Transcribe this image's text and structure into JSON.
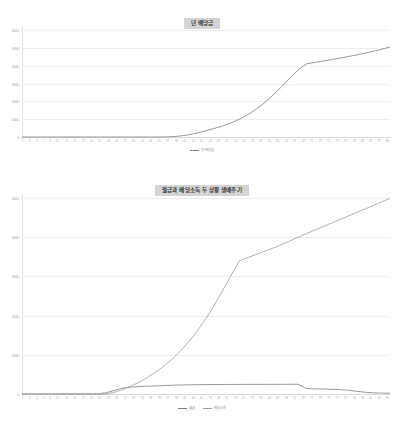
{
  "page": {
    "background": "#ffffff",
    "text_color": "#808080"
  },
  "charts": [
    {
      "id": "chart-1",
      "title": "년 배당금",
      "title_bg": "#d4d4d4",
      "legend": [
        {
          "label": "년 배당금",
          "color": "#7d7d7d"
        }
      ]
    },
    {
      "id": "chart-2",
      "title": "월급과 배당소득 두 상황 생애주기",
      "title_bg": "#d4d4d4",
      "legend": [
        {
          "label": "월급",
          "color": "#7d7d7d"
        },
        {
          "label": "배당소득",
          "color": "#9c9c9c"
        }
      ]
    }
  ],
  "chart_data": [
    {
      "type": "line",
      "title": "년 배당금",
      "xlabel": "",
      "ylabel": "",
      "grid": true,
      "legend_position": "bottom",
      "ylim": [
        0,
        6000
      ],
      "yticks": [
        0,
        1000,
        2000,
        3000,
        4000,
        5000,
        6000
      ],
      "ytick_labels": [
        "0",
        "1000",
        "2000",
        "3000",
        "4000",
        "5000",
        "6000"
      ],
      "x": [
        1,
        3,
        5,
        7,
        9,
        11,
        13,
        15,
        17,
        19,
        21,
        23,
        25,
        27,
        29,
        31,
        33,
        35,
        37,
        39,
        41,
        43,
        45,
        47,
        49,
        51,
        53,
        55,
        57,
        59,
        61,
        63,
        65,
        67,
        69,
        71,
        73,
        75,
        77,
        79,
        81,
        83,
        85,
        87,
        89
      ],
      "xtick_labels": [
        "1",
        "3",
        "5",
        "7",
        "9",
        "11",
        "13",
        "15",
        "17",
        "19",
        "21",
        "23",
        "25",
        "27",
        "29",
        "31",
        "33",
        "35",
        "37",
        "39",
        "41",
        "43",
        "45",
        "47",
        "49",
        "51",
        "53",
        "55",
        "57",
        "59",
        "61",
        "63",
        "65",
        "67",
        "69",
        "71",
        "73",
        "75",
        "77",
        "79",
        "81",
        "83",
        "85",
        "87",
        "89"
      ],
      "series": [
        {
          "name": "년 배당금",
          "color": "#7d7d7d",
          "values": [
            0,
            0,
            0,
            0,
            0,
            0,
            0,
            0,
            0,
            0,
            0,
            0,
            0,
            0,
            0,
            0,
            0,
            0,
            20,
            60,
            130,
            230,
            350,
            480,
            620,
            790,
            1000,
            1250,
            1560,
            1920,
            2340,
            2800,
            3280,
            3760,
            4100,
            4180,
            4260,
            4340,
            4420,
            4510,
            4600,
            4700,
            4810,
            4920,
            5050
          ]
        }
      ]
    },
    {
      "type": "line",
      "title": "월급과 배당소득 두 상황 생애주기",
      "xlabel": "",
      "ylabel": "",
      "grid": true,
      "legend_position": "bottom",
      "ylim": [
        0,
        5000
      ],
      "yticks": [
        0,
        1000,
        2000,
        3000,
        4000,
        5000
      ],
      "ytick_labels": [
        "0",
        "1000",
        "2000",
        "3000",
        "4000",
        "5000"
      ],
      "x": [
        1,
        3,
        5,
        7,
        9,
        11,
        13,
        15,
        17,
        19,
        21,
        23,
        25,
        27,
        29,
        31,
        33,
        35,
        37,
        39,
        41,
        43,
        45,
        47,
        49,
        51,
        53,
        55,
        57,
        59,
        61,
        63,
        65,
        67,
        69,
        71,
        73,
        75,
        77,
        79,
        81,
        83,
        85,
        87,
        89
      ],
      "xtick_labels": [
        "1",
        "3",
        "5",
        "7",
        "9",
        "11",
        "13",
        "15",
        "17",
        "19",
        "21",
        "23",
        "25",
        "27",
        "29",
        "31",
        "33",
        "35",
        "37",
        "39",
        "41",
        "43",
        "45",
        "47",
        "49",
        "51",
        "53",
        "55",
        "57",
        "59",
        "61",
        "63",
        "65",
        "67",
        "69",
        "71",
        "73",
        "75",
        "77",
        "79",
        "81",
        "83",
        "85",
        "87",
        "89"
      ],
      "series": [
        {
          "name": "월급",
          "color": "#7d7d7d",
          "values": [
            0,
            0,
            0,
            0,
            0,
            0,
            0,
            0,
            0,
            0,
            30,
            90,
            150,
            175,
            190,
            200,
            205,
            215,
            225,
            230,
            235,
            238,
            240,
            242,
            243,
            244,
            245,
            245,
            246,
            246,
            247,
            247,
            248,
            248,
            140,
            130,
            128,
            120,
            112,
            95,
            70,
            45,
            30,
            22,
            20
          ]
        },
        {
          "name": "배당소득",
          "color": "#9c9c9c",
          "values": [
            0,
            0,
            0,
            0,
            0,
            0,
            0,
            0,
            0,
            0,
            0,
            40,
            110,
            200,
            300,
            420,
            560,
            720,
            900,
            1110,
            1350,
            1620,
            1930,
            2270,
            2640,
            3030,
            3400,
            3480,
            3560,
            3640,
            3720,
            3810,
            3900,
            4000,
            4090,
            4180,
            4270,
            4360,
            4450,
            4540,
            4630,
            4720,
            4810,
            4900,
            4990
          ]
        }
      ]
    }
  ]
}
